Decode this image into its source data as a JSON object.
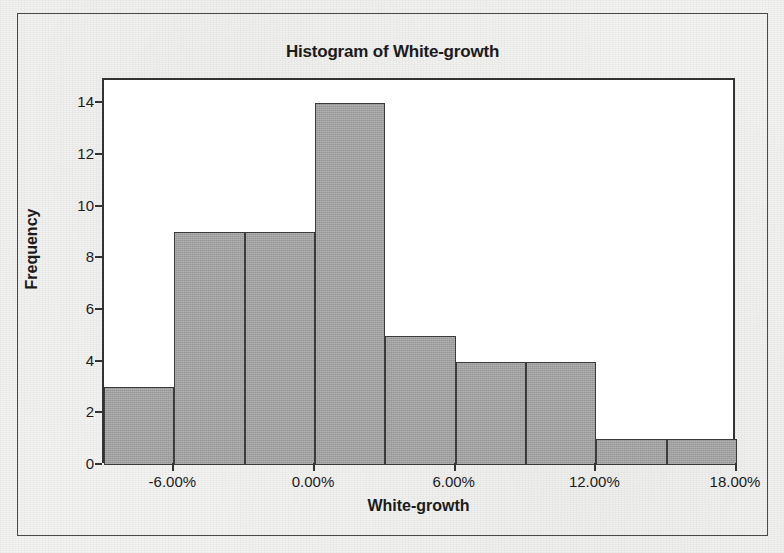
{
  "figure": {
    "title": "Histogram of White-growth",
    "background_color": "#f3f3f2",
    "frame_color": "#4a4a4a",
    "plot_background": "#ffffff",
    "axis_color": "#333333",
    "bar_fill_color": "#a4a4a4",
    "bar_edge_color": "#3a3a3a"
  },
  "chart_data": {
    "type": "bar",
    "title": "Histogram of White-growth",
    "xlabel": "White-growth",
    "ylabel": "Frequency",
    "grid": false,
    "legend": false,
    "bin_width": 3,
    "xlim": [
      -9,
      18
    ],
    "ylim": [
      0,
      14.9
    ],
    "x_tick_labels": [
      "-6.00%",
      "0.00%",
      "6.00%",
      "12.00%",
      "18.00%"
    ],
    "x_tick_values": [
      -6,
      0,
      6,
      12,
      18
    ],
    "y_tick_labels": [
      "0",
      "2",
      "4",
      "6",
      "8",
      "10",
      "12",
      "14"
    ],
    "y_tick_values": [
      0,
      2,
      4,
      6,
      8,
      10,
      12,
      14
    ],
    "bins": [
      {
        "label": "-9% to -6%",
        "start": -9,
        "end": -6,
        "value": 3
      },
      {
        "label": "-6% to -3%",
        "start": -6,
        "end": -3,
        "value": 9
      },
      {
        "label": "-3% to 0%",
        "start": -3,
        "end": 0,
        "value": 9
      },
      {
        "label": "0% to 3%",
        "start": 0,
        "end": 3,
        "value": 14
      },
      {
        "label": "3% to 6%",
        "start": 3,
        "end": 6,
        "value": 5
      },
      {
        "label": "6% to 9%",
        "start": 6,
        "end": 9,
        "value": 4
      },
      {
        "label": "9% to 12%",
        "start": 9,
        "end": 12,
        "value": 4
      },
      {
        "label": "12% to 15%",
        "start": 12,
        "end": 15,
        "value": 1
      },
      {
        "label": "15% to 18%",
        "start": 15,
        "end": 18,
        "value": 1
      }
    ],
    "categories": [
      "-9% to -6%",
      "-6% to -3%",
      "-3% to 0%",
      "0% to 3%",
      "3% to 6%",
      "6% to 9%",
      "9% to 12%",
      "12% to 15%",
      "15% to 18%"
    ],
    "values": [
      3,
      9,
      9,
      14,
      5,
      4,
      4,
      1,
      1
    ]
  }
}
